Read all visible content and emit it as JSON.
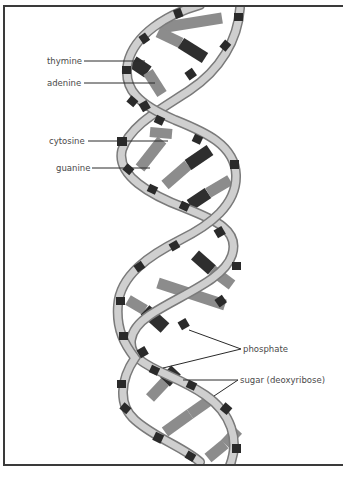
{
  "figure": {
    "colors": {
      "background": "#ffffff",
      "frame": "#3a3a3a",
      "backbone_fill": "#cfcfcf",
      "backbone_outline": "#7a7a7a",
      "phosphate": "#2a2a2a",
      "base_light": "#8c8c8c",
      "base_dark": "#2e2e2e",
      "label_text": "#4a4a4a",
      "leader_line": "#2a2a2a"
    }
  },
  "labels": {
    "thymine": "thymine",
    "adenine": "adenine",
    "cytosine": "cytosine",
    "guanine": "guanine",
    "phosphate": "phosphate",
    "sugar": "sugar (deoxyribose)"
  }
}
